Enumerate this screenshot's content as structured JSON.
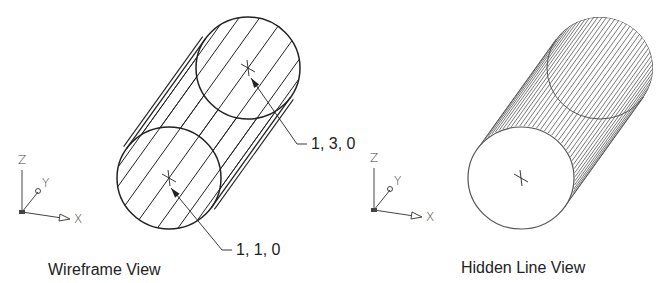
{
  "colors": {
    "stroke": "#222222",
    "hatch": "#555555",
    "label": "#222222",
    "background": "#ffffff"
  },
  "views": [
    {
      "id": "wireframe",
      "caption": "Wireframe View",
      "caption_pos": [
        48,
        262
      ],
      "front_center": [
        169,
        178
      ],
      "back_center": [
        248,
        68
      ],
      "rx": 52,
      "ry": 51,
      "style": "wireframe",
      "center_marks": true,
      "annotations": [
        {
          "text": "1, 1, 0",
          "tip": [
            171,
            188
          ],
          "elbow": [
            222,
            250
          ],
          "end": [
            232,
            250
          ],
          "pos": [
            236,
            242
          ]
        },
        {
          "text": "1, 3, 0",
          "tip": [
            251,
            78
          ],
          "elbow": [
            297,
            144
          ],
          "end": [
            307,
            144
          ],
          "pos": [
            311,
            136
          ]
        }
      ],
      "ucs": {
        "origin": [
          22,
          212
        ],
        "z": "Z",
        "y": "Y",
        "x": "X"
      }
    },
    {
      "id": "hidden-line",
      "caption": "Hidden Line View",
      "caption_pos": [
        461,
        260
      ],
      "front_center": [
        521,
        178
      ],
      "back_center": [
        600,
        68
      ],
      "rx": 53,
      "ry": 51,
      "style": "hidden",
      "center_marks": true,
      "annotations": [],
      "ucs": {
        "origin": [
          374,
          210
        ],
        "z": "Z",
        "y": "Y",
        "x": "X"
      }
    }
  ]
}
